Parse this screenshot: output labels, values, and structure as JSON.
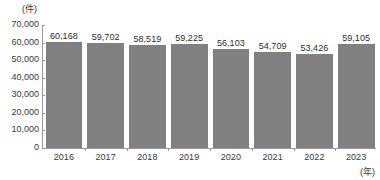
{
  "chart_data": {
    "type": "bar",
    "title": "",
    "subtitle": "",
    "xlabel": "(年)",
    "ylabel": "(件)",
    "categories": [
      "2016",
      "2017",
      "2018",
      "2019",
      "2020",
      "2021",
      "2022",
      "2023"
    ],
    "values": [
      60168,
      59702,
      58519,
      59225,
      56103,
      54709,
      53426,
      59105
    ],
    "value_labels": [
      "60,168",
      "59,702",
      "58,519",
      "59,225",
      "56,103",
      "54,709",
      "53,426",
      "59,105"
    ],
    "series": [
      {
        "name": "",
        "values": [
          60168,
          59702,
          58519,
          59225,
          56103,
          54709,
          53426,
          59105
        ]
      }
    ],
    "ylim": [
      0,
      70000
    ],
    "ytick_values": [
      70000,
      60000,
      50000,
      40000,
      30000,
      20000,
      10000,
      0
    ],
    "ytick_labels": [
      "70,000",
      "60,000",
      "50,000",
      "40,000",
      "30,000",
      "20,000",
      "10,000",
      "0"
    ],
    "grid": false,
    "legend": false,
    "legend_position": "none",
    "bar_color": "#808080",
    "axis_color": "#9a9a9a",
    "text_color": "#333333",
    "background_color": "#ffffff"
  }
}
